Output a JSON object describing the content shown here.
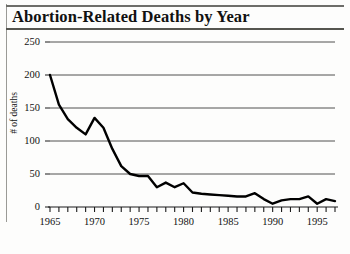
{
  "figure": {
    "title": "Abortion-Related Deaths by Year"
  },
  "chart_data": {
    "type": "line",
    "title": "Abortion-Related Deaths by Year",
    "xlabel": "",
    "ylabel": "# of deaths",
    "xlim": [
      1965,
      1997
    ],
    "ylim": [
      0,
      250
    ],
    "grid": true,
    "legend": null,
    "y_ticks": [
      250,
      200,
      150,
      100,
      50,
      0
    ],
    "y_tick_labels": [
      "250",
      "200",
      "150",
      "100",
      "50",
      "0"
    ],
    "x_ticks": [
      1965,
      1970,
      1975,
      1980,
      1985,
      1990,
      1995
    ],
    "x_tick_labels": [
      "1965",
      "1970",
      "1975",
      "1980",
      "1985",
      "1990",
      "1995"
    ],
    "x_minor_tick_interval": 1,
    "line_color": "#000000",
    "line_width": 2.4,
    "x": [
      1965,
      1966,
      1967,
      1968,
      1969,
      1970,
      1971,
      1972,
      1973,
      1974,
      1975,
      1976,
      1977,
      1978,
      1979,
      1980,
      1981,
      1982,
      1983,
      1984,
      1985,
      1986,
      1987,
      1988,
      1989,
      1990,
      1991,
      1992,
      1993,
      1994,
      1995,
      1996,
      1997
    ],
    "values": [
      200,
      155,
      133,
      120,
      110,
      135,
      120,
      88,
      62,
      50,
      47,
      47,
      30,
      37,
      30,
      36,
      22,
      20,
      19,
      18,
      17,
      16,
      16,
      21,
      12,
      5,
      10,
      12,
      12,
      16,
      5,
      12,
      9
    ],
    "series": [
      {
        "name": "Abortion-related deaths",
        "values": [
          200,
          155,
          133,
          120,
          110,
          135,
          120,
          88,
          62,
          50,
          47,
          47,
          30,
          37,
          30,
          36,
          22,
          20,
          19,
          18,
          17,
          16,
          16,
          21,
          12,
          5,
          10,
          12,
          12,
          16,
          5,
          12,
          9
        ]
      }
    ]
  }
}
